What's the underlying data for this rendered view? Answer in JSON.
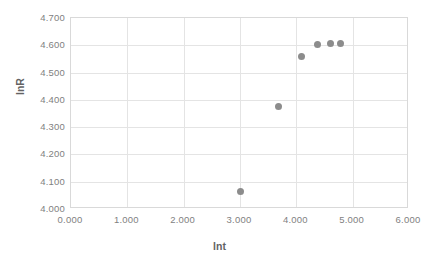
{
  "chart_data": {
    "type": "scatter",
    "title": "",
    "xlabel": "lnt",
    "ylabel": "lnR",
    "xlim": [
      0.0,
      6.0
    ],
    "ylim": [
      4.0,
      4.7
    ],
    "xtick_step": 1.0,
    "ytick_step": 0.1,
    "grid": true,
    "legend": "none",
    "marker_color": "#8c8c8c",
    "marker_shape": "circle",
    "gridline_color": "#e4e4e4",
    "plot_border_color": "#d9d9d9",
    "tick_label_color": "#7f7f7f",
    "axis_title_color": "#636363",
    "xticks": [
      "0.000",
      "1.000",
      "2.000",
      "3.000",
      "4.000",
      "5.000",
      "6.000"
    ],
    "xtick_values": [
      0.0,
      1.0,
      2.0,
      3.0,
      4.0,
      5.0,
      6.0
    ],
    "yticks": [
      "4.000",
      "4.100",
      "4.200",
      "4.300",
      "4.400",
      "4.500",
      "4.600",
      "4.700"
    ],
    "ytick_values": [
      4.0,
      4.1,
      4.2,
      4.3,
      4.4,
      4.5,
      4.6,
      4.7
    ],
    "series": [
      {
        "name": "lnR vs lnt",
        "x": [
          3.0,
          3.68,
          4.1,
          4.38,
          4.6,
          4.78
        ],
        "y": [
          4.065,
          4.375,
          4.56,
          4.602,
          4.607,
          4.608
        ]
      }
    ]
  },
  "caption": {
    "text": ""
  }
}
